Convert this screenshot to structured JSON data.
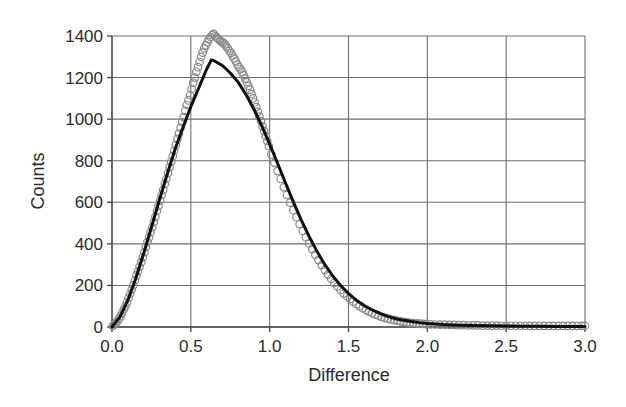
{
  "chart_data": {
    "type": "scatter",
    "title": "",
    "subtitle": "",
    "xlabel": "Difference",
    "ylabel": "Counts",
    "xlim": [
      0.0,
      3.0
    ],
    "ylim": [
      0,
      1400
    ],
    "grid": true,
    "legend": null,
    "legend_position": "none",
    "x_ticks": [
      0.0,
      0.5,
      1.0,
      1.5,
      2.0,
      2.5,
      3.0
    ],
    "x_tick_labels": [
      "0.0",
      "0.5",
      "1.0",
      "1.5",
      "2.0",
      "2.5",
      "3.0"
    ],
    "y_ticks": [
      0,
      200,
      400,
      600,
      800,
      1000,
      1200,
      1400
    ],
    "y_tick_labels": [
      "0",
      "200",
      "400",
      "600",
      "800",
      "1000",
      "1200",
      "1400"
    ],
    "annotations": [],
    "marker_style": "open-circle",
    "marker_edge_color": "#888888",
    "marker_face_color": "none",
    "marker_size_px": 7.5,
    "curve_color": "#101010",
    "curve_width_px": 3,
    "grid_color": "#6e6e6e",
    "axis_color": "#4a4a4a",
    "background_color": "#ffffff",
    "series": [
      {
        "name": "Counts (observed)",
        "type": "scatter",
        "x": [
          0.005,
          0.015,
          0.025,
          0.035,
          0.045,
          0.055,
          0.065,
          0.075,
          0.085,
          0.095,
          0.105,
          0.115,
          0.125,
          0.135,
          0.145,
          0.155,
          0.165,
          0.175,
          0.185,
          0.195,
          0.205,
          0.215,
          0.225,
          0.235,
          0.245,
          0.255,
          0.265,
          0.275,
          0.285,
          0.295,
          0.305,
          0.315,
          0.325,
          0.335,
          0.345,
          0.355,
          0.365,
          0.375,
          0.385,
          0.395,
          0.405,
          0.415,
          0.425,
          0.435,
          0.445,
          0.455,
          0.465,
          0.475,
          0.485,
          0.495,
          0.505,
          0.515,
          0.525,
          0.535,
          0.545,
          0.555,
          0.565,
          0.575,
          0.585,
          0.595,
          0.605,
          0.615,
          0.625,
          0.635,
          0.645,
          0.655,
          0.665,
          0.675,
          0.685,
          0.695,
          0.705,
          0.715,
          0.725,
          0.735,
          0.745,
          0.755,
          0.765,
          0.775,
          0.785,
          0.795,
          0.805,
          0.815,
          0.825,
          0.835,
          0.845,
          0.855,
          0.865,
          0.875,
          0.885,
          0.895,
          0.905,
          0.915,
          0.925,
          0.935,
          0.945,
          0.955,
          0.965,
          0.975,
          0.985,
          0.995,
          1.01,
          1.03,
          1.05,
          1.07,
          1.09,
          1.11,
          1.13,
          1.15,
          1.17,
          1.19,
          1.21,
          1.23,
          1.25,
          1.27,
          1.29,
          1.31,
          1.33,
          1.35,
          1.37,
          1.39,
          1.41,
          1.43,
          1.45,
          1.47,
          1.49,
          1.51,
          1.53,
          1.55,
          1.57,
          1.59,
          1.61,
          1.63,
          1.65,
          1.67,
          1.69,
          1.71,
          1.73,
          1.75,
          1.77,
          1.79,
          1.81,
          1.83,
          1.85,
          1.87,
          1.89,
          1.91,
          1.93,
          1.95,
          1.97,
          1.99,
          2.02,
          2.05,
          2.08,
          2.11,
          2.14,
          2.17,
          2.2,
          2.23,
          2.26,
          2.29,
          2.32,
          2.35,
          2.38,
          2.41,
          2.44,
          2.47,
          2.5,
          2.53,
          2.56,
          2.59,
          2.62,
          2.65,
          2.68,
          2.71,
          2.74,
          2.77,
          2.8,
          2.83,
          2.86,
          2.89,
          2.92,
          2.95,
          2.98,
          3.0
        ],
        "y": [
          5,
          12,
          20,
          28,
          40,
          52,
          68,
          85,
          100,
          118,
          140,
          160,
          180,
          200,
          225,
          248,
          268,
          290,
          312,
          335,
          360,
          385,
          408,
          430,
          455,
          480,
          505,
          530,
          558,
          582,
          608,
          635,
          660,
          688,
          712,
          740,
          768,
          795,
          822,
          848,
          875,
          905,
          930,
          958,
          985,
          1010,
          1040,
          1068,
          1090,
          1115,
          1145,
          1175,
          1200,
          1228,
          1250,
          1275,
          1300,
          1320,
          1340,
          1355,
          1370,
          1385,
          1395,
          1405,
          1410,
          1400,
          1392,
          1385,
          1378,
          1372,
          1368,
          1360,
          1350,
          1340,
          1328,
          1318,
          1305,
          1292,
          1278,
          1262,
          1250,
          1240,
          1228,
          1212,
          1195,
          1178,
          1160,
          1142,
          1120,
          1100,
          1080,
          1058,
          1035,
          1012,
          990,
          965,
          942,
          918,
          895,
          870,
          830,
          790,
          750,
          712,
          672,
          635,
          598,
          562,
          528,
          495,
          462,
          432,
          402,
          375,
          348,
          322,
          298,
          275,
          252,
          232,
          212,
          195,
          178,
          162,
          148,
          135,
          122,
          110,
          100,
          90,
          82,
          74,
          66,
          60,
          54,
          48,
          44,
          40,
          36,
          33,
          30,
          27,
          25,
          22,
          20,
          19,
          17,
          16,
          15,
          14,
          13,
          12,
          11,
          11,
          10,
          10,
          9,
          9,
          8,
          8,
          8,
          7,
          7,
          7,
          7,
          6,
          6,
          6,
          6,
          6,
          6,
          5,
          5,
          5,
          5,
          5,
          5,
          5,
          5,
          5,
          5,
          5,
          5,
          5
        ]
      },
      {
        "name": "Fitted curve",
        "type": "line",
        "peak_x": 0.63,
        "peak_y": 1285,
        "x": [
          0.0,
          0.05,
          0.1,
          0.15,
          0.2,
          0.25,
          0.3,
          0.35,
          0.4,
          0.45,
          0.5,
          0.55,
          0.6,
          0.63,
          0.65,
          0.7,
          0.75,
          0.8,
          0.85,
          0.9,
          0.95,
          1.0,
          1.05,
          1.1,
          1.15,
          1.2,
          1.25,
          1.3,
          1.35,
          1.4,
          1.45,
          1.5,
          1.55,
          1.6,
          1.65,
          1.7,
          1.75,
          1.8,
          1.85,
          1.9,
          1.95,
          2.0,
          2.1,
          2.2,
          2.3,
          2.4,
          2.5,
          2.6,
          2.7,
          2.8,
          2.9,
          3.0
        ],
        "y": [
          0,
          48,
          128,
          232,
          352,
          480,
          610,
          735,
          855,
          960,
          1060,
          1150,
          1240,
          1285,
          1280,
          1258,
          1222,
          1178,
          1118,
          1048,
          968,
          880,
          788,
          694,
          602,
          515,
          436,
          364,
          300,
          246,
          200,
          161,
          129,
          103,
          82,
          65,
          51,
          40,
          32,
          26,
          21,
          17,
          12,
          9,
          7,
          6,
          5,
          4,
          4,
          3,
          3,
          3
        ]
      }
    ]
  },
  "figure": {
    "x_axis_label": "Difference",
    "y_axis_label": "Counts"
  }
}
